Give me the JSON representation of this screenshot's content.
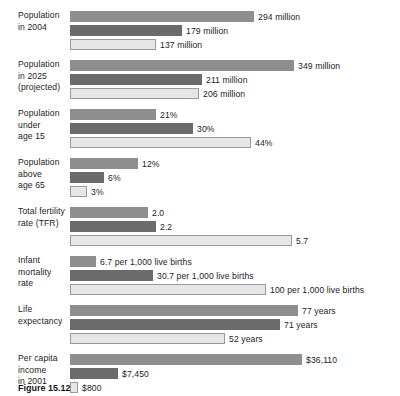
{
  "chart_data": {
    "type": "bar",
    "title": "",
    "subtitle": "",
    "xlabel": "",
    "ylabel": "",
    "orientation": "horizontal",
    "grid": false,
    "legend_position": "none",
    "categories": [
      "Population in 2004",
      "Population in 2025 (projected)",
      "Population under age 15",
      "Population above age 65",
      "Total fertility rate (TFR)",
      "Infant mortality rate",
      "Life expectancy",
      "Per capita income in 2001"
    ],
    "series": [
      {
        "name": "series-1",
        "color": "#8e8e8e",
        "values": [
          294,
          349,
          21,
          12,
          2.0,
          6.7,
          77,
          36110
        ],
        "labels": [
          "294 million",
          "349 million",
          "21%",
          "12%",
          "2.0",
          "6.7 per 1,000 live births",
          "77 years",
          "$36,110"
        ]
      },
      {
        "name": "series-2",
        "color": "#6b6b6b",
        "values": [
          179,
          211,
          30,
          6,
          2.2,
          30.7,
          71,
          7450
        ],
        "labels": [
          "179 million",
          "211 million",
          "30%",
          "6%",
          "2.2",
          "30.7 per 1,000 live births",
          "71 years",
          "$7,450"
        ]
      },
      {
        "name": "series-3",
        "color": "#e6e6e6",
        "values": [
          137,
          206,
          44,
          3,
          5.7,
          100,
          52,
          800
        ],
        "labels": [
          "137 million",
          "206 million",
          "44%",
          "3%",
          "5.7",
          "100 per 1,000 live births",
          "52 years",
          "$800"
        ]
      }
    ],
    "groups": [
      {
        "label_lines": [
          "Population",
          "in 2004"
        ],
        "bars": [
          {
            "series": 0,
            "value": 294,
            "label": "294 million",
            "width_px": 184
          },
          {
            "series": 1,
            "value": 179,
            "label": "179 million",
            "width_px": 112
          },
          {
            "series": 2,
            "value": 137,
            "label": "137 million",
            "width_px": 86
          }
        ]
      },
      {
        "label_lines": [
          "Population",
          "in 2025",
          "(projected)"
        ],
        "bars": [
          {
            "series": 0,
            "value": 349,
            "label": "349 million",
            "width_px": 224
          },
          {
            "series": 1,
            "value": 211,
            "label": "211 million",
            "width_px": 132
          },
          {
            "series": 2,
            "value": 206,
            "label": "206 million",
            "width_px": 129
          }
        ]
      },
      {
        "label_lines": [
          "Population",
          "under",
          "age 15"
        ],
        "bars": [
          {
            "series": 0,
            "value": 21,
            "label": "21%",
            "width_px": 86
          },
          {
            "series": 1,
            "value": 30,
            "label": "30%",
            "width_px": 123
          },
          {
            "series": 2,
            "value": 44,
            "label": "44%",
            "width_px": 181
          }
        ]
      },
      {
        "label_lines": [
          "Population",
          "above",
          "age 65"
        ],
        "bars": [
          {
            "series": 0,
            "value": 12,
            "label": "12%",
            "width_px": 68
          },
          {
            "series": 1,
            "value": 6,
            "label": "6%",
            "width_px": 34
          },
          {
            "series": 2,
            "value": 3,
            "label": "3%",
            "width_px": 17
          }
        ]
      },
      {
        "label_lines": [
          "Total fertility",
          "rate (TFR)"
        ],
        "bars": [
          {
            "series": 0,
            "value": 2.0,
            "label": "2.0",
            "width_px": 78
          },
          {
            "series": 1,
            "value": 2.2,
            "label": "2.2",
            "width_px": 86
          },
          {
            "series": 2,
            "value": 5.7,
            "label": "5.7",
            "width_px": 222
          }
        ]
      },
      {
        "label_lines": [
          "Infant",
          "mortality",
          "rate"
        ],
        "bars": [
          {
            "series": 0,
            "value": 6.7,
            "label": "6.7 per 1,000 live births",
            "width_px": 26
          },
          {
            "series": 1,
            "value": 30.7,
            "label": "30.7 per 1,000 live births",
            "width_px": 83
          },
          {
            "series": 2,
            "value": 100,
            "label": "100 per 1,000 live births",
            "width_px": 196
          }
        ]
      },
      {
        "label_lines": [
          "Life",
          "expectancy"
        ],
        "bars": [
          {
            "series": 0,
            "value": 77,
            "label": "77 years",
            "width_px": 228
          },
          {
            "series": 1,
            "value": 71,
            "label": "71 years",
            "width_px": 210
          },
          {
            "series": 2,
            "value": 52,
            "label": "52 years",
            "width_px": 155
          }
        ]
      },
      {
        "label_lines": [
          "Per capita",
          "income",
          "in 2001"
        ],
        "bars": [
          {
            "series": 0,
            "value": 36110,
            "label": "$36,110",
            "width_px": 232
          },
          {
            "series": 1,
            "value": 7450,
            "label": "$7,450",
            "width_px": 48
          },
          {
            "series": 2,
            "value": 800,
            "label": "$800",
            "width_px": 8
          }
        ]
      }
    ]
  },
  "caption": {
    "figure_number": "Figure 15.12",
    "text": ""
  }
}
